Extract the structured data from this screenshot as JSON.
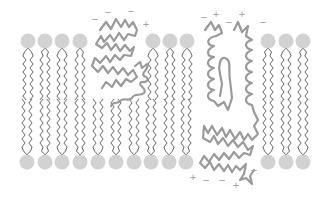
{
  "diagram": {
    "type": "lipid-bilayer-with-membrane-proteins",
    "colors": {
      "background": "#ffffff",
      "lipid_head": "#d2d2d2",
      "lipid_tail": "#555555",
      "protein": "#9a9a9a",
      "charge_label": "#9a9a9a"
    },
    "top_leaflet": {
      "head_y": 41,
      "head_x": [
        28,
        45,
        62,
        80,
        153,
        170,
        187,
        268,
        286,
        303
      ]
    },
    "bottom_leaflet": {
      "head_y": 162,
      "head_x": [
        27,
        45,
        62,
        80,
        98,
        116,
        134,
        151,
        169,
        186,
        268,
        286,
        303
      ]
    },
    "proteins": [
      {
        "name": "peripheral-zigzag-protein",
        "region": "left-upper"
      },
      {
        "name": "coiled-helix-protein-left",
        "region": "center"
      },
      {
        "name": "transmembrane-helical-protein",
        "region": "center-right"
      },
      {
        "name": "coiled-helix-protein-right",
        "region": "center-right"
      }
    ],
    "charges_top": [
      {
        "sign": "−",
        "x": 95,
        "y": 22
      },
      {
        "sign": "−",
        "x": 108,
        "y": 15
      },
      {
        "sign": "−",
        "x": 131,
        "y": 14
      },
      {
        "sign": "+",
        "x": 146,
        "y": 27
      },
      {
        "sign": "−",
        "x": 204,
        "y": 20
      },
      {
        "sign": "+",
        "x": 216,
        "y": 17
      },
      {
        "sign": "−",
        "x": 229,
        "y": 25
      },
      {
        "sign": "+",
        "x": 242,
        "y": 17
      },
      {
        "sign": "−",
        "x": 263,
        "y": 25
      }
    ],
    "charges_bottom": [
      {
        "sign": "+",
        "x": 193,
        "y": 180
      },
      {
        "sign": "−",
        "x": 206,
        "y": 183
      },
      {
        "sign": "−",
        "x": 222,
        "y": 183
      },
      {
        "sign": "+",
        "x": 236,
        "y": 188
      },
      {
        "sign": "−",
        "x": 254,
        "y": 173
      }
    ]
  }
}
